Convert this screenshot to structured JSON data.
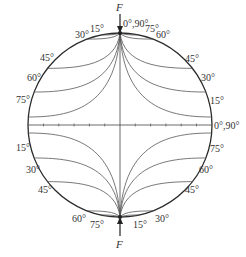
{
  "diagram": {
    "force_label_top": "F",
    "force_label_bottom": "F",
    "top_point_label": "0°,90°",
    "axis_end_label": "0°,90°",
    "upper_left_labels": [
      "15°",
      "30°",
      "45°",
      "60°",
      "75°"
    ],
    "upper_right_labels": [
      "75°",
      "60°",
      "45°",
      "30°",
      "15°"
    ],
    "lower_left_labels": [
      "15°",
      "30°",
      "45°",
      "60°",
      "75°"
    ],
    "lower_right_labels": [
      "75°",
      "60°",
      "45°",
      "30°",
      "15°"
    ]
  }
}
